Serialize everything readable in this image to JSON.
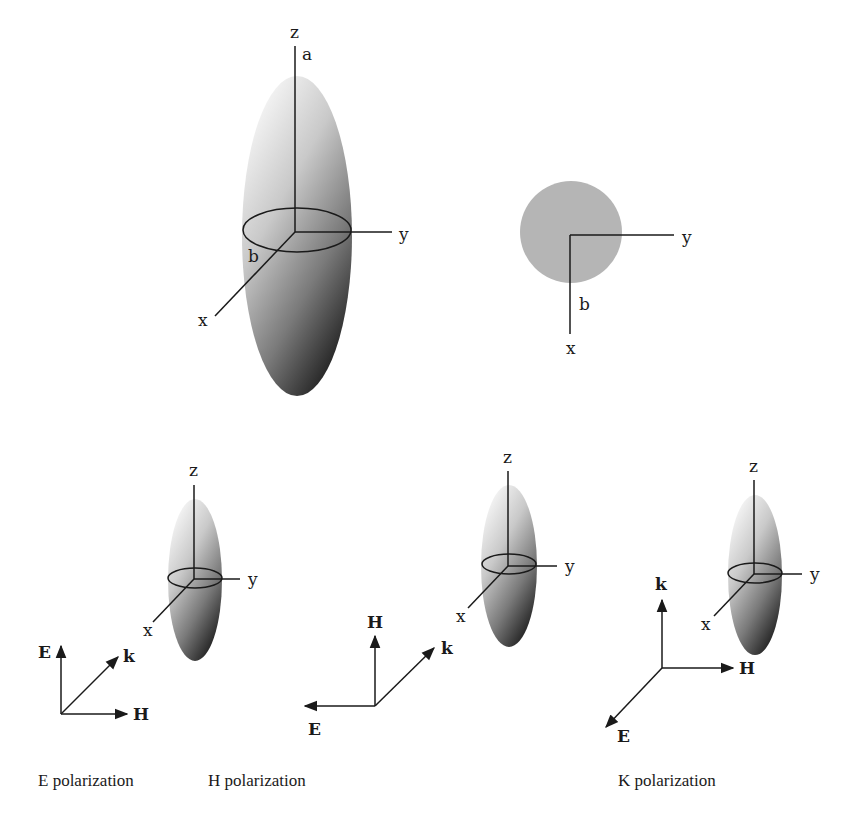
{
  "top_left": {
    "axis_z": "z",
    "axis_y": "y",
    "axis_x": "x",
    "semi_axis_a": "a",
    "semi_axis_b": "b"
  },
  "top_right": {
    "axis_y": "y",
    "axis_x": "x",
    "radius_b": "b"
  },
  "panels": [
    {
      "axis_z": "z",
      "axis_y": "y",
      "axis_x": "x",
      "vec_up": "E",
      "vec_diag": "k",
      "vec_side": "H",
      "caption": "E polarization"
    },
    {
      "axis_z": "z",
      "axis_y": "y",
      "axis_x": "x",
      "vec_up": "H",
      "vec_diag": "k",
      "vec_side": "E",
      "caption": "H polarization"
    },
    {
      "axis_z": "z",
      "axis_y": "y",
      "axis_x": "x",
      "vec_up": "k",
      "vec_diag": "E",
      "vec_side": "H",
      "caption": "K polarization"
    }
  ],
  "colors": {
    "ellipsoid_light": "#f4f4f4",
    "ellipsoid_dark": "#2e2e2e",
    "disc": "#b5b5b5",
    "line": "#1a1a1a"
  }
}
